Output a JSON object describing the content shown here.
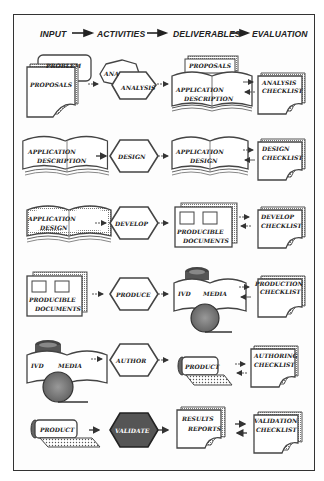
{
  "header": {
    "columns": [
      "INPUT",
      "ACTIVITIES",
      "DELIVERABLES",
      "EVALUATION"
    ]
  },
  "rows": [
    {
      "inputs": [
        "PROBLEM",
        "PROPOSALS"
      ],
      "activities": [
        "ANA",
        "ANALYSIS"
      ],
      "deliverables": [
        "PROPOSALS",
        "APPLICATION",
        "DESCRIPTION"
      ],
      "evaluation": [
        "ANALYSIS",
        "CHECKLIST"
      ]
    },
    {
      "inputs": [
        "APPLICATION",
        "DESCRIPTION"
      ],
      "activities": [
        "DESIGN"
      ],
      "deliverables": [
        "APPLICATION",
        "DESIGN"
      ],
      "evaluation": [
        "DESIGN",
        "CHECKLIST"
      ]
    },
    {
      "inputs": [
        "APPLICATION",
        "DESIGN"
      ],
      "activities": [
        "DEVELOP"
      ],
      "deliverables": [
        "PRODUCIBLE",
        "DOCUMENTS"
      ],
      "evaluation": [
        "DEVELOP",
        "CHECKLIST"
      ]
    },
    {
      "inputs": [
        "PRODUCIBLE",
        "DOCUMENTS"
      ],
      "activities": [
        "PRODUCE"
      ],
      "deliverables": [
        "IVD",
        "MEDIA"
      ],
      "evaluation": [
        "PRODUCTION",
        "CHECKLIST"
      ]
    },
    {
      "inputs": [
        "IVD",
        "MEDIA"
      ],
      "activities": [
        "AUTHOR"
      ],
      "deliverables": [
        "PRODUCT"
      ],
      "evaluation": [
        "AUTHORING",
        "CHECKLIST"
      ]
    },
    {
      "inputs": [
        "PRODUCT"
      ],
      "activities": [
        "VALIDATE"
      ],
      "deliverables": [
        "RESULTS",
        "REPORTS"
      ],
      "evaluation": [
        "VALIDATION",
        "CHECKLIST"
      ]
    }
  ],
  "colors": {
    "ink": "#222222",
    "shade": "#8a8a8a",
    "validate_fill": "#555555"
  }
}
